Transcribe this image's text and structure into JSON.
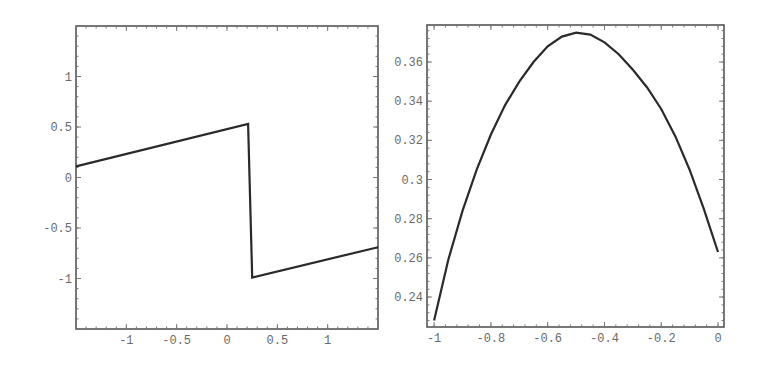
{
  "chart_data": [
    {
      "type": "line",
      "title": "",
      "xlabel": "",
      "ylabel": "",
      "xlim": [
        -1.5,
        1.5
      ],
      "ylim": [
        -1.5,
        1.5
      ],
      "grid": false,
      "legend": null,
      "xticks": [
        -1,
        -0.5,
        0,
        0.5,
        1
      ],
      "xtick_labels": [
        "-1",
        "-0.5",
        "0",
        "0.5",
        "1"
      ],
      "yticks": [
        -1,
        -0.5,
        0,
        0.5,
        1
      ],
      "ytick_labels": [
        "-1",
        "-0.5",
        "0",
        "0.5",
        "1"
      ],
      "series": [
        {
          "name": "piecewise-linear",
          "x": [
            -1.5,
            0.21,
            0.25,
            1.5
          ],
          "y": [
            0.11,
            0.53,
            -0.99,
            -0.69
          ]
        }
      ],
      "frame": {
        "left": 76,
        "top": 26,
        "right": 378,
        "bottom": 329
      }
    },
    {
      "type": "line",
      "title": "",
      "xlabel": "",
      "ylabel": "",
      "xlim": [
        -1.025,
        0.021
      ],
      "ylim": [
        0.2247,
        0.3789
      ],
      "grid": false,
      "legend": null,
      "xticks": [
        -1,
        -0.8,
        -0.6,
        -0.4,
        -0.2,
        0
      ],
      "xtick_labels": [
        "-1",
        "-0.8",
        "-0.6",
        "-0.4",
        "-0.2",
        "0"
      ],
      "yticks": [
        0.24,
        0.26,
        0.28,
        0.3,
        0.32,
        0.34,
        0.36
      ],
      "ytick_labels": [
        "0.24",
        "0.26",
        "0.28",
        "0.3",
        "0.32",
        "0.34",
        "0.36"
      ],
      "series": [
        {
          "name": "curve",
          "x": [
            -1.0,
            -0.95,
            -0.9,
            -0.85,
            -0.8,
            -0.75,
            -0.7,
            -0.65,
            -0.6,
            -0.55,
            -0.5,
            -0.45,
            -0.4,
            -0.35,
            -0.3,
            -0.25,
            -0.2,
            -0.15,
            -0.1,
            -0.05,
            0.0
          ],
          "y": [
            0.228,
            0.259,
            0.284,
            0.305,
            0.323,
            0.338,
            0.35,
            0.36,
            0.368,
            0.373,
            0.375,
            0.374,
            0.37,
            0.364,
            0.356,
            0.347,
            0.336,
            0.322,
            0.305,
            0.285,
            0.263
          ]
        }
      ],
      "frame": {
        "left": 427,
        "top": 25,
        "right": 724,
        "bottom": 327
      }
    }
  ]
}
